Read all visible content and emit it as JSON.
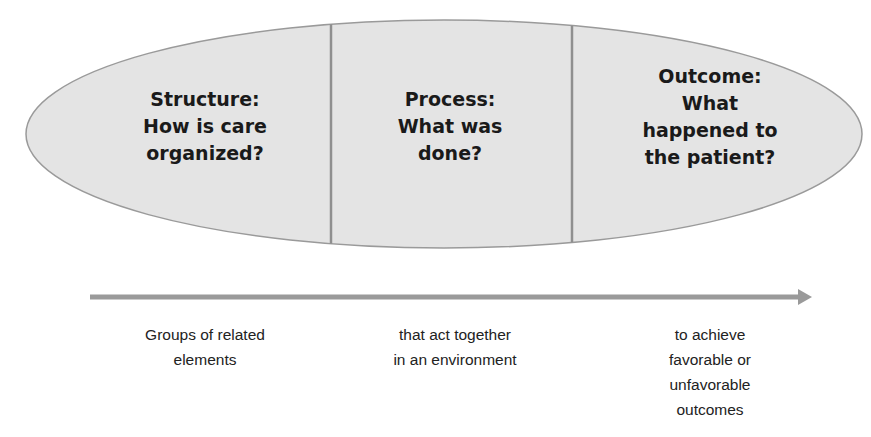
{
  "diagram": {
    "ellipse_fill": "#e4e4e4",
    "ellipse_stroke": "#9a9a9a",
    "divider_color": "#8f8f8f",
    "arrow_color": "#9a9a9a",
    "sections": [
      {
        "id": "structure",
        "lines": [
          "Structure:",
          "How is care",
          "organized?"
        ]
      },
      {
        "id": "process",
        "lines": [
          "Process:",
          "What was",
          "done?"
        ]
      },
      {
        "id": "outcome",
        "lines": [
          "Outcome:",
          "What",
          "happened to",
          "the patient?"
        ]
      }
    ],
    "captions": [
      {
        "lines": [
          "Groups of related",
          "elements"
        ]
      },
      {
        "lines": [
          "that act together",
          "in an environment"
        ]
      },
      {
        "lines": [
          "to achieve",
          "favorable or",
          "unfavorable",
          "outcomes"
        ]
      }
    ]
  }
}
